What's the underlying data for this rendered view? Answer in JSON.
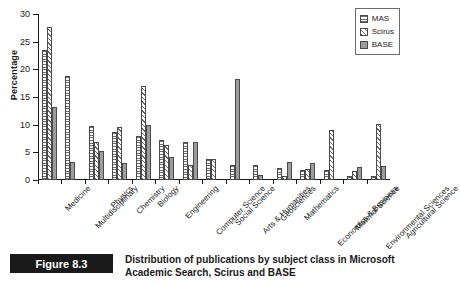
{
  "chart_data": {
    "type": "bar",
    "title": "",
    "xlabel": "",
    "ylabel": "Percentage",
    "ylim": [
      0,
      30
    ],
    "yticks": [
      0,
      5,
      10,
      15,
      20,
      25,
      30
    ],
    "grid": false,
    "legend_position": "top-right",
    "categories": [
      "Medicine",
      "Multidisciplinary",
      "Physics",
      "Chemistry",
      "Biology",
      "Engineering",
      "Computer Science",
      "Social Science",
      "Arts & Humanities",
      "Geosciences",
      "Mathematics",
      "Economics & Business",
      "Material Science",
      "Environmental Sciences",
      "Agricultural Science"
    ],
    "series": [
      {
        "name": "MAS",
        "pattern": "horizontal-lines",
        "values": [
          23.5,
          18.8,
          9.8,
          8.7,
          8.0,
          7.2,
          6.9,
          3.8,
          2.8,
          2.7,
          2.1,
          1.8,
          1.8,
          0.8,
          0.8
        ]
      },
      {
        "name": "Scirus",
        "pattern": "diagonal-hatch",
        "values": [
          27.7,
          0,
          6.9,
          9.6,
          17.0,
          6.3,
          2.8,
          3.8,
          0,
          0,
          0.7,
          2.0,
          9.0,
          1.7,
          10.2
        ]
      },
      {
        "name": "BASE",
        "pattern": "solid-gray",
        "values": [
          13.2,
          3.3,
          5.2,
          3.1,
          10.0,
          4.2,
          6.9,
          0,
          18.3,
          0.9,
          3.2,
          3.1,
          0,
          2.3,
          2.5
        ]
      }
    ]
  },
  "legend": {
    "items": [
      {
        "label": "MAS"
      },
      {
        "label": "Scirus"
      },
      {
        "label": "BASE"
      }
    ]
  },
  "caption": {
    "figure_number": "Figure 8.3",
    "text": "Distribution of publications by subject class in Microsoft Academic Search, Scirus and BASE"
  },
  "colors": {
    "axis": "#1a1a1a",
    "base_fill": "#9d9d9d",
    "pattern_stroke": "#6b6b6b",
    "caption_box": "#1a1a1a"
  }
}
